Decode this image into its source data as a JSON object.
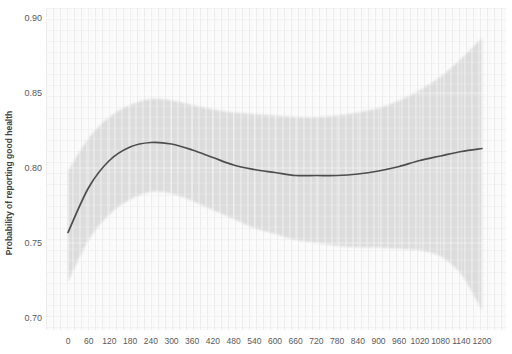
{
  "chart": {
    "y_axis_title": "Probability of reporting good health",
    "y_tick_labels": [
      "0.90",
      "0.85",
      "0.80",
      "0.75",
      "0.70"
    ],
    "x_tick_labels": [
      "0",
      "60",
      "120",
      "180",
      "240",
      "300",
      "360",
      "420",
      "480",
      "540",
      "600",
      "660",
      "720",
      "780",
      "840",
      "900",
      "960",
      "1020",
      "1080",
      "1140",
      "1200"
    ]
  },
  "colors": {
    "background": "#ffffff",
    "plot_background": "#fbfafa",
    "ci_band": "#d9d9d9",
    "line": "#4d4d4d",
    "tick_text": "#595959",
    "axis_title_text": "#3f3f3f",
    "gridline": "#ffffff"
  },
  "chart_data": {
    "type": "line",
    "title": "",
    "xlabel": "",
    "ylabel": "Probability of reporting good health",
    "x": [
      0,
      60,
      120,
      180,
      240,
      300,
      360,
      420,
      480,
      540,
      600,
      660,
      720,
      780,
      840,
      900,
      960,
      1020,
      1080,
      1140,
      1200
    ],
    "series": [
      {
        "name": "Predicted probability",
        "role": "mean",
        "values": [
          0.757,
          0.787,
          0.805,
          0.814,
          0.817,
          0.816,
          0.812,
          0.807,
          0.802,
          0.799,
          0.797,
          0.795,
          0.795,
          0.795,
          0.796,
          0.798,
          0.801,
          0.805,
          0.808,
          0.811,
          0.813
        ]
      },
      {
        "name": "CI upper bound",
        "role": "band_upper",
        "values": [
          0.798,
          0.82,
          0.834,
          0.842,
          0.846,
          0.845,
          0.842,
          0.839,
          0.837,
          0.836,
          0.835,
          0.834,
          0.834,
          0.835,
          0.837,
          0.84,
          0.845,
          0.852,
          0.861,
          0.873,
          0.887
        ]
      },
      {
        "name": "CI lower bound",
        "role": "band_lower",
        "values": [
          0.724,
          0.752,
          0.769,
          0.779,
          0.784,
          0.783,
          0.778,
          0.772,
          0.766,
          0.76,
          0.756,
          0.752,
          0.75,
          0.748,
          0.747,
          0.747,
          0.746,
          0.745,
          0.741,
          0.729,
          0.705
        ]
      }
    ],
    "band": {
      "between": [
        "CI upper bound",
        "CI lower bound"
      ],
      "style": "solid shaded, soft edges"
    },
    "xlim": [
      0,
      1200
    ],
    "ylim": [
      0.7,
      0.9
    ],
    "x_tick_step": 60,
    "y_tick_step": 0.05,
    "grid": "faint white gridlines visible over shaded band",
    "legend": "none"
  }
}
